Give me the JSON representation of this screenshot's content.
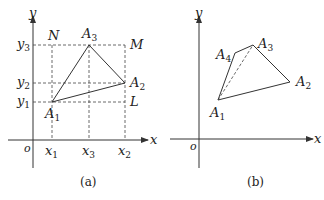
{
  "panel_a": {
    "caption": "(a)",
    "axis_x": "x",
    "axis_y": "y",
    "origin": "o",
    "x_ticks": [
      {
        "base": "x",
        "sub": "1"
      },
      {
        "base": "x",
        "sub": "3"
      },
      {
        "base": "x",
        "sub": "2"
      }
    ],
    "y_ticks": [
      {
        "base": "y",
        "sub": "3"
      },
      {
        "base": "y",
        "sub": "2"
      },
      {
        "base": "y",
        "sub": "1"
      }
    ],
    "rect_corners": {
      "N": "N",
      "M": "M",
      "L": "L"
    },
    "vertices": [
      {
        "base": "A",
        "sub": "1"
      },
      {
        "base": "A",
        "sub": "2"
      },
      {
        "base": "A",
        "sub": "3"
      }
    ]
  },
  "panel_b": {
    "caption": "(b)",
    "axis_x": "x",
    "axis_y": "y",
    "origin": "o",
    "vertices": [
      {
        "base": "A",
        "sub": "1"
      },
      {
        "base": "A",
        "sub": "2"
      },
      {
        "base": "A",
        "sub": "3"
      },
      {
        "base": "A",
        "sub": "4"
      }
    ]
  },
  "colors": {
    "stroke": "#333333",
    "background": "#ffffff"
  }
}
